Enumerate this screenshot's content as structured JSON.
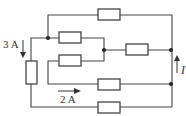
{
  "diagram": {
    "type": "circuit",
    "labels": {
      "current_left": "3 A",
      "current_bottom": "2 A",
      "current_right": "I"
    },
    "resistors": [
      {
        "id": "R_top",
        "orientation": "horizontal"
      },
      {
        "id": "R_mid_upper",
        "orientation": "horizontal"
      },
      {
        "id": "R_mid_right",
        "orientation": "horizontal"
      },
      {
        "id": "R_mid_lower",
        "orientation": "horizontal"
      },
      {
        "id": "R_lower",
        "orientation": "horizontal"
      },
      {
        "id": "R_bottom",
        "orientation": "horizontal"
      },
      {
        "id": "R_left",
        "orientation": "vertical"
      }
    ],
    "arrows": [
      {
        "label": "3 A",
        "direction": "down"
      },
      {
        "label": "2 A",
        "direction": "right"
      },
      {
        "label": "I",
        "direction": "up"
      }
    ],
    "colors": {
      "line": "#444444",
      "background": "#ffffff"
    }
  }
}
